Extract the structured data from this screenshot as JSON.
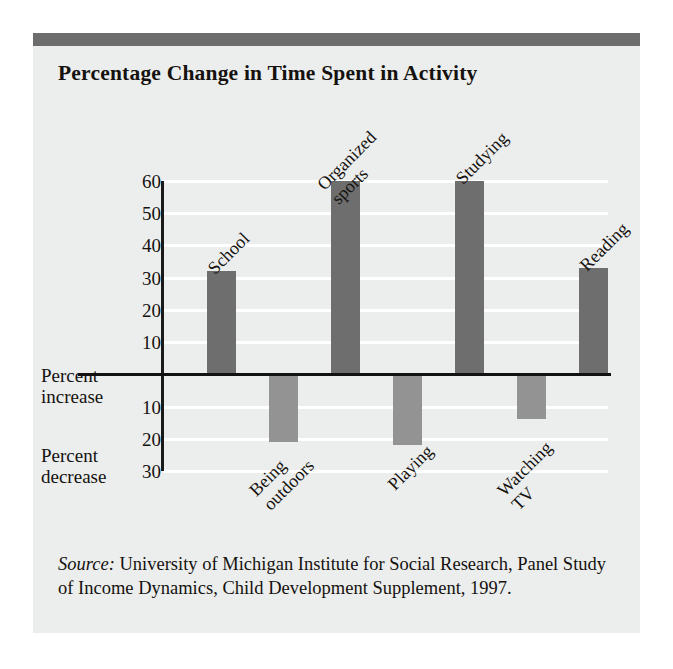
{
  "chart_data": {
    "type": "bar",
    "title": "Percentage Change in Time Spent in Activity",
    "xlabel": "",
    "ylabel": "",
    "ylim": [
      -30,
      60
    ],
    "grid": true,
    "legend": "none",
    "axis_note_positive": "Percent increase",
    "axis_note_negative": "Percent decrease",
    "ytick_labels_positive": [
      "60",
      "50",
      "40",
      "30",
      "20",
      "10"
    ],
    "ytick_values_positive": [
      60,
      50,
      40,
      30,
      20,
      10
    ],
    "ytick_labels_negative": [
      "10",
      "20",
      "30"
    ],
    "ytick_values_negative": [
      -10,
      -20,
      -30
    ],
    "categories": [
      "School",
      "Being outdoors",
      "Organized sports",
      "Playing",
      "Studying",
      "Watching TV",
      "Reading"
    ],
    "values": [
      32,
      -21,
      60,
      -22,
      60,
      -14,
      33
    ],
    "bars": [
      {
        "label_line1": "School",
        "label_line2": "",
        "value": 32,
        "direction": "positive"
      },
      {
        "label_line1": "Being",
        "label_line2": "outdoors",
        "value": -21,
        "direction": "negative"
      },
      {
        "label_line1": "Organized",
        "label_line2": "sports",
        "value": 60,
        "direction": "positive"
      },
      {
        "label_line1": "Playing",
        "label_line2": "",
        "value": -22,
        "direction": "negative"
      },
      {
        "label_line1": "Studying",
        "label_line2": "",
        "value": 60,
        "direction": "positive"
      },
      {
        "label_line1": "Watching",
        "label_line2": "TV",
        "value": -14,
        "direction": "negative"
      },
      {
        "label_line1": "Reading",
        "label_line2": "",
        "value": 33,
        "direction": "positive"
      }
    ],
    "colors": {
      "positive_bar": "#6e6e6e",
      "negative_bar": "#939393",
      "background": "#eceeed",
      "gridline": "#ffffff",
      "axis": "#121212",
      "header_rule": "#6d6d6d"
    }
  },
  "source": {
    "label": "Source:",
    "text": " University of Michigan Institute for Social Research, Panel Study of Income Dynamics, Child Development Supplement, 1997."
  }
}
